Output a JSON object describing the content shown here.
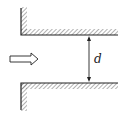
{
  "diagram": {
    "type": "channel-flow",
    "flow_arrow": {
      "direction": "right",
      "style": "hollow"
    },
    "dimension": {
      "label": "d",
      "meaning": "gap between plates"
    },
    "colors": {
      "line": "#222222",
      "hatch": "#555555",
      "background": "#ffffff"
    }
  }
}
